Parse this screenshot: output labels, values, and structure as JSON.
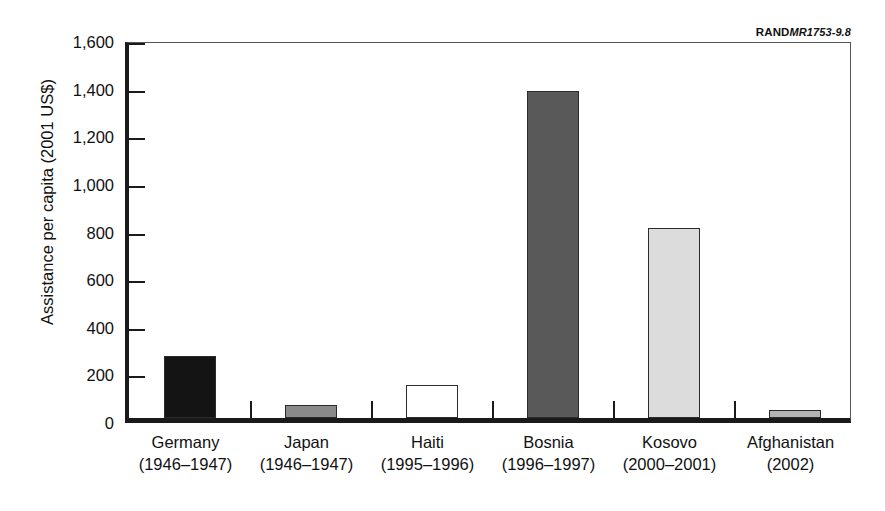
{
  "source_tag": {
    "brand": "RAND",
    "document_id": "MR1753-9.8"
  },
  "chart_data": {
    "type": "bar",
    "title": "",
    "subtitle": "",
    "xlabel": "",
    "ylabel": "Assistance per capita (2001 US$)",
    "ylim": [
      0,
      1600
    ],
    "ytick_values": [
      0,
      200,
      400,
      600,
      800,
      1000,
      1200,
      1400,
      1600
    ],
    "ytick_labels": [
      "0",
      "200",
      "400",
      "600",
      "800",
      "1,000",
      "1,200",
      "1,400",
      "1,600"
    ],
    "grid": false,
    "legend": null,
    "legend_position": "none",
    "categories": [
      "Germany",
      "Japan",
      "Haiti",
      "Bosnia",
      "Kosovo",
      "Afghanistan"
    ],
    "category_periods": [
      "(1946–1947)",
      "(1946–1947)",
      "(1995–1996)",
      "(1996–1997)",
      "(2000–2001)",
      "(2002)"
    ],
    "values": [
      262,
      55,
      140,
      1375,
      800,
      33
    ],
    "bar_colors": [
      "#141414",
      "#8a8a8a",
      "#ffffff",
      "#595959",
      "#dcdcdc",
      "#b4b4b4"
    ],
    "bar_edge_color": "#2b2b2b",
    "bars": [
      {
        "category": "Germany",
        "period": "(1946–1947)",
        "value": 262,
        "color": "#141414"
      },
      {
        "category": "Japan",
        "period": "(1946–1947)",
        "value": 55,
        "color": "#8a8a8a"
      },
      {
        "category": "Haiti",
        "period": "(1995–1996)",
        "value": 140,
        "color": "#ffffff"
      },
      {
        "category": "Bosnia",
        "period": "(1996–1997)",
        "value": 1375,
        "color": "#595959"
      },
      {
        "category": "Kosovo",
        "period": "(2000–2001)",
        "value": 800,
        "color": "#dcdcdc"
      },
      {
        "category": "Afghanistan",
        "period": "(2002)",
        "value": 33,
        "color": "#b4b4b4"
      }
    ]
  }
}
